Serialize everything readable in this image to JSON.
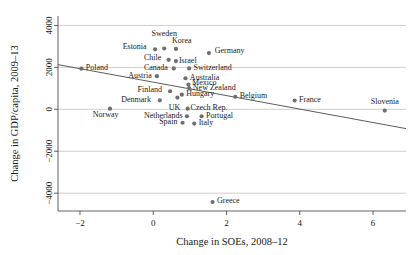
{
  "chart_data": {
    "type": "scatter",
    "title": "",
    "xlabel": "Change in SOEs, 2008–12",
    "ylabel": "Change in GDP/capita, 2009–13",
    "xlim": [
      -2.6,
      6.9
    ],
    "ylim": [
      -4850,
      4450
    ],
    "xticks": [
      -2,
      0,
      2,
      4,
      6
    ],
    "xtick_labels": [
      "−2",
      "0",
      "2",
      "4",
      "6"
    ],
    "yticks": [
      -4000,
      -2000,
      0,
      2000,
      4000
    ],
    "ytick_labels": [
      "−4000",
      "−2000",
      "0",
      "2000",
      "4000"
    ],
    "grid": true,
    "grid_axis": "y",
    "legend": "none",
    "series": [
      {
        "name": "OECD countries",
        "marker": "circle",
        "color": "#6e6e6e",
        "points": [
          {
            "label": "Sweden",
            "x": 0.3,
            "y": 2900,
            "lx": 0.3,
            "ly": 3620,
            "anchor": "middle"
          },
          {
            "label": "Korea",
            "x": 0.62,
            "y": 2880,
            "lx": 0.78,
            "ly": 3270,
            "anchor": "middle"
          },
          {
            "label": "Estonia",
            "x": 0.05,
            "y": 2860,
            "lx": -0.18,
            "ly": 2980,
            "anchor": "end"
          },
          {
            "label": "Germany",
            "x": 1.52,
            "y": 2680,
            "lx": 1.68,
            "ly": 2800,
            "anchor": "start"
          },
          {
            "label": "Chile",
            "x": 0.42,
            "y": 2360,
            "lx": 0.22,
            "ly": 2460,
            "anchor": "end"
          },
          {
            "label": "Israel",
            "x": 0.62,
            "y": 2300,
            "lx": 0.7,
            "ly": 2330,
            "anchor": "start"
          },
          {
            "label": "Canada",
            "x": 0.56,
            "y": 1950,
            "lx": 0.4,
            "ly": 2000,
            "anchor": "end"
          },
          {
            "label": "Switzerland",
            "x": 0.98,
            "y": 1950,
            "lx": 1.1,
            "ly": 2000,
            "anchor": "start"
          },
          {
            "label": "Poland",
            "x": -1.96,
            "y": 1940,
            "lx": -1.84,
            "ly": 1990,
            "anchor": "start"
          },
          {
            "label": "Austria",
            "x": 0.1,
            "y": 1580,
            "lx": -0.04,
            "ly": 1630,
            "anchor": "end"
          },
          {
            "label": "Australia",
            "x": 0.88,
            "y": 1480,
            "lx": 1.0,
            "ly": 1520,
            "anchor": "start"
          },
          {
            "label": "Mexico",
            "x": 0.96,
            "y": 1180,
            "lx": 1.06,
            "ly": 1260,
            "anchor": "start"
          },
          {
            "label": "New Zealand",
            "x": 0.98,
            "y": 1010,
            "lx": 1.08,
            "ly": 1020,
            "anchor": "start"
          },
          {
            "label": "Finland",
            "x": 0.46,
            "y": 860,
            "lx": 0.24,
            "ly": 960,
            "anchor": "end"
          },
          {
            "label": "Hungary",
            "x": 0.78,
            "y": 700,
            "lx": 0.9,
            "ly": 740,
            "anchor": "start"
          },
          {
            "label": "Belgium",
            "x": 2.24,
            "y": 600,
            "lx": 2.36,
            "ly": 640,
            "anchor": "start"
          },
          {
            "label": "Denmark",
            "x": 0.18,
            "y": 430,
            "lx": -0.06,
            "ly": 490,
            "anchor": "end"
          },
          {
            "label": "UK",
            "x": 0.66,
            "y": 560,
            "lx": 0.58,
            "ly": 100,
            "anchor": "middle"
          },
          {
            "label": "Norway",
            "x": -1.18,
            "y": 30,
            "lx": -1.3,
            "ly": -230,
            "anchor": "middle"
          },
          {
            "label": "Czech Rep.",
            "x": 0.94,
            "y": 30,
            "lx": 1.02,
            "ly": 80,
            "anchor": "start"
          },
          {
            "label": "Netherlands",
            "x": 0.92,
            "y": -330,
            "lx": 0.8,
            "ly": -280,
            "anchor": "end"
          },
          {
            "label": "Portugal",
            "x": 1.32,
            "y": -330,
            "lx": 1.44,
            "ly": -280,
            "anchor": "start"
          },
          {
            "label": "Spain",
            "x": 0.8,
            "y": -640,
            "lx": 0.66,
            "ly": -590,
            "anchor": "end"
          },
          {
            "label": "Italy",
            "x": 1.12,
            "y": -680,
            "lx": 1.24,
            "ly": -630,
            "anchor": "start"
          },
          {
            "label": "France",
            "x": 3.86,
            "y": 420,
            "lx": 3.98,
            "ly": 470,
            "anchor": "start"
          },
          {
            "label": "Slovenia",
            "x": 6.32,
            "y": -60,
            "lx": 6.32,
            "ly": 380,
            "anchor": "middle"
          },
          {
            "label": "Greece",
            "x": 1.62,
            "y": -4420,
            "lx": 1.74,
            "ly": -4370,
            "anchor": "start"
          }
        ]
      }
    ],
    "trendline": {
      "name": "fitted regression line",
      "x_start": -2.6,
      "y_start": 2130,
      "x_end": 6.9,
      "y_end": -920,
      "color": "#4a4a4a"
    }
  }
}
